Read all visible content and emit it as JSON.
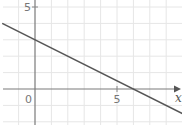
{
  "chart_data": {
    "type": "line",
    "title": "",
    "xlabel": "x",
    "ylabel": "",
    "xlim": [
      -2,
      9
    ],
    "ylim": [
      -2.2,
      5.5
    ],
    "grid": true,
    "grid_step": 1,
    "x_ticks": [
      {
        "value": 0,
        "label": "0"
      },
      {
        "value": 5,
        "label": "5"
      }
    ],
    "y_ticks": [
      {
        "value": 5,
        "label": "5"
      }
    ],
    "series": [
      {
        "name": "y = 3 - 0.5x",
        "slope": -0.5,
        "intercept": 3,
        "x": [
          -2,
          9
        ],
        "y": [
          4,
          -1.5
        ],
        "color": "#555555"
      }
    ],
    "legend": "none"
  }
}
